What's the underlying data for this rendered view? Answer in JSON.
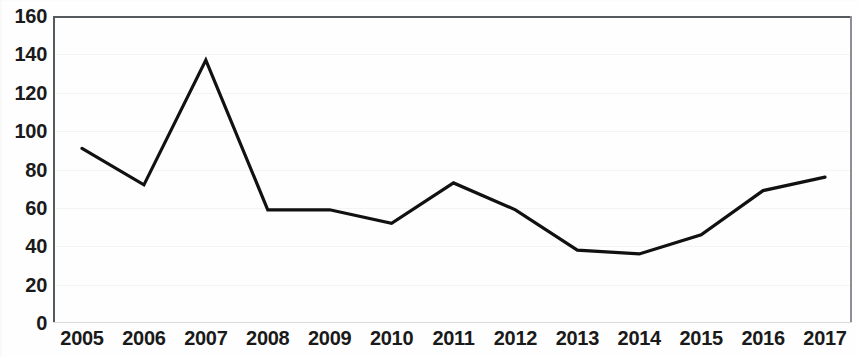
{
  "chart_data": {
    "type": "line",
    "title": "",
    "subtitle": "",
    "xlabel": "",
    "ylabel": "",
    "categories": [
      "2005",
      "2006",
      "2007",
      "2008",
      "2009",
      "2010",
      "2011",
      "2012",
      "2013",
      "2014",
      "2015",
      "2016",
      "2017"
    ],
    "values": [
      91,
      72,
      137,
      59,
      59,
      52,
      73,
      59,
      38,
      36,
      46,
      69,
      76
    ],
    "series": [
      {
        "name": "",
        "values": [
          91,
          72,
          137,
          59,
          59,
          52,
          73,
          59,
          38,
          36,
          46,
          69,
          76
        ]
      }
    ],
    "ylim": [
      0,
      160
    ],
    "y_ticks": [
      0,
      20,
      40,
      60,
      80,
      100,
      120,
      140,
      160
    ],
    "y_tick_labels": [
      "0",
      "20",
      "40",
      "60",
      "80",
      "100",
      "120",
      "140",
      "160"
    ],
    "x_tick_labels": [
      "2005",
      "2006",
      "2007",
      "2008",
      "2009",
      "2010",
      "2011",
      "2012",
      "2013",
      "2014",
      "2015",
      "2016",
      "2017"
    ],
    "grid": true,
    "grid_axis": "y",
    "legend": false,
    "legend_position": "none",
    "markers": false,
    "line_color": "#111111",
    "line_width": 3,
    "annotations": []
  },
  "axes": {
    "frame_color": "#555a5e",
    "gridline_color": "#f4f4f3"
  }
}
